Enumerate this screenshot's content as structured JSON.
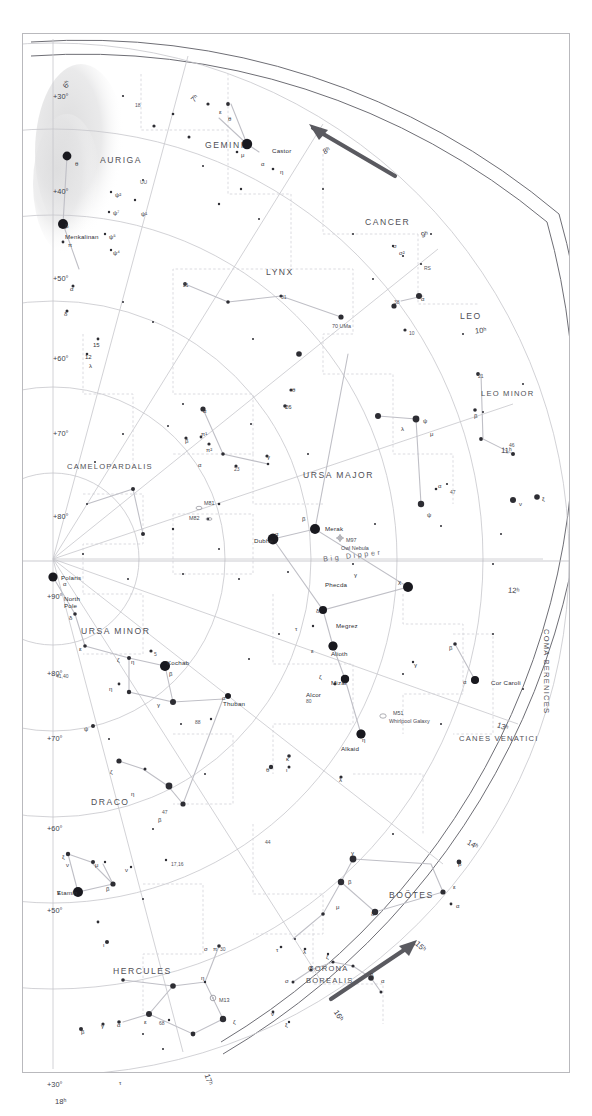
{
  "title": "STAR MAP 2: NORTHERN STARS TO DEC. +30°",
  "chart_data": {
    "type": "scatter",
    "title": "STAR MAP 2: NORTHERN STARS TO DEC. +30°",
    "projection": "polar-azimuthal north",
    "grid": true,
    "xlabel": "Right Ascension (hours)",
    "ylabel": "Declination (degrees)",
    "declination_labels": [
      "+90°",
      "+80°",
      "+70°",
      "+60°",
      "+50°",
      "+40°",
      "+30°"
    ],
    "ra_labels": [
      "6ʰ",
      "7ʰ",
      "8ʰ",
      "9ʰ",
      "10ʰ",
      "11ʰ",
      "12ʰ",
      "13ʰ",
      "14ʰ",
      "15ʰ",
      "16ʰ",
      "17ʰ",
      "18ʰ"
    ],
    "constellations": [
      "AURIGA",
      "GEMINI",
      "CANCER",
      "LYNX",
      "LEO",
      "LEO MINOR",
      "CAMELOPARDALIS",
      "URSA MAJOR",
      "URSA MINOR",
      "DRACO",
      "CANES VENATICI",
      "COMA BERENICES",
      "BOÖTES",
      "CORONA BOREALIS",
      "HERCULES"
    ],
    "named_stars": [
      "Castor",
      "Menkalinan",
      "Polaris",
      "Kochab",
      "Thuban",
      "Etamin",
      "Dubhe",
      "Merak",
      "Phecda",
      "Megrez",
      "Alioth",
      "Mizar",
      "Alcor",
      "Alkaid",
      "Cor Caroli"
    ],
    "deep_sky_objects": [
      "M81",
      "M82",
      "M97 Owl Nebula",
      "M51 Whirlpool Galaxy",
      "M13"
    ],
    "asterisms": [
      "Big Dipper"
    ]
  },
  "declination": [
    {
      "text": "+90°",
      "x": 24,
      "y": 558
    },
    {
      "text": "+80°",
      "x": 24,
      "y": 635
    },
    {
      "text": "+70°",
      "x": 24,
      "y": 700
    },
    {
      "text": "+60°",
      "x": 24,
      "y": 790
    },
    {
      "text": "+50°",
      "x": 24,
      "y": 872
    },
    {
      "text": "+30°",
      "x": 24,
      "y": 1046
    },
    {
      "text": "+30°",
      "x": 30,
      "y": 58
    },
    {
      "text": "+40°",
      "x": 30,
      "y": 153
    },
    {
      "text": "+50°",
      "x": 30,
      "y": 240
    },
    {
      "text": "+60°",
      "x": 30,
      "y": 320
    },
    {
      "text": "+70°",
      "x": 30,
      "y": 395
    },
    {
      "text": "+80°",
      "x": 30,
      "y": 478
    }
  ],
  "ra_ticks": [
    {
      "text": "6ʰ",
      "x": 40,
      "y": 46,
      "rot": -62
    },
    {
      "text": "7ʰ",
      "x": 168,
      "y": 60,
      "rot": -46
    },
    {
      "text": "8ʰ",
      "x": 300,
      "y": 112,
      "rot": -28
    },
    {
      "text": "9ʰ",
      "x": 398,
      "y": 196,
      "rot": -14
    },
    {
      "text": "10ʰ",
      "x": 452,
      "y": 292,
      "rot": -6
    },
    {
      "text": "11ʰ",
      "x": 478,
      "y": 412,
      "rot": 2
    },
    {
      "text": "12ʰ",
      "x": 485,
      "y": 552,
      "rot": 6
    },
    {
      "text": "13ʰ",
      "x": 474,
      "y": 688,
      "rot": 18
    },
    {
      "text": "14ʰ",
      "x": 444,
      "y": 806,
      "rot": 30
    },
    {
      "text": "15ʰ",
      "x": 392,
      "y": 908,
      "rot": 44
    },
    {
      "text": "16ʰ",
      "x": 310,
      "y": 977,
      "rot": 58
    },
    {
      "text": "17ʰ",
      "x": 180,
      "y": 1041,
      "rot": 70
    },
    {
      "text": "18ʰ",
      "x": 32,
      "y": 1063,
      "rot": 0
    }
  ],
  "constellation_labels": [
    {
      "text": "AURIGA",
      "x": 77,
      "y": 121,
      "cls": "const"
    },
    {
      "text": "GEMINI",
      "x": 182,
      "y": 106,
      "cls": "const"
    },
    {
      "text": "CANCER",
      "x": 342,
      "y": 183,
      "cls": "const"
    },
    {
      "text": "LYNX",
      "x": 243,
      "y": 233,
      "cls": "const"
    },
    {
      "text": "LEO",
      "x": 437,
      "y": 277,
      "cls": "const"
    },
    {
      "text": "LEO MINOR",
      "x": 458,
      "y": 355,
      "cls": "const sm"
    },
    {
      "text": "CAMELOPARDALIS",
      "x": 44,
      "y": 428,
      "cls": "const sm"
    },
    {
      "text": "URSA MAJOR",
      "x": 280,
      "y": 436,
      "cls": "const"
    },
    {
      "text": "URSA MINOR",
      "x": 58,
      "y": 592,
      "cls": "const"
    },
    {
      "text": "DRACO",
      "x": 68,
      "y": 763,
      "cls": "const"
    },
    {
      "text": "CANES VENATICI",
      "x": 436,
      "y": 700,
      "cls": "const sm"
    },
    {
      "text": "BOÖTES",
      "x": 366,
      "y": 856,
      "cls": "const"
    },
    {
      "text": "CORONA",
      "x": 285,
      "y": 930,
      "cls": "const sm"
    },
    {
      "text": "BOREALIS",
      "x": 283,
      "y": 942,
      "cls": "const sm"
    },
    {
      "text": "HERCULES",
      "x": 90,
      "y": 932,
      "cls": "const"
    }
  ],
  "coma_berenices": "COMA BERENICES",
  "star_labels": [
    {
      "text": "Castor",
      "x": 249,
      "y": 113
    },
    {
      "text": "Menkalinan",
      "x": 42,
      "y": 199
    },
    {
      "text": "Polaris",
      "x": 38,
      "y": 540
    },
    {
      "text": "North",
      "x": 41,
      "y": 561
    },
    {
      "text": "Pole",
      "x": 41,
      "y": 568
    },
    {
      "text": "Kochab",
      "x": 144,
      "y": 625
    },
    {
      "text": "Thuban",
      "x": 200,
      "y": 666
    },
    {
      "text": "Etamin",
      "x": 34,
      "y": 855
    },
    {
      "text": "Dubhe",
      "x": 231,
      "y": 503
    },
    {
      "text": "Merak",
      "x": 302,
      "y": 491
    },
    {
      "text": "Phecda",
      "x": 302,
      "y": 547
    },
    {
      "text": "Megrez",
      "x": 313,
      "y": 588
    },
    {
      "text": "Alioth",
      "x": 308,
      "y": 616
    },
    {
      "text": "Mizar",
      "x": 308,
      "y": 645
    },
    {
      "text": "Alcor",
      "x": 283,
      "y": 657
    },
    {
      "text": "Alkaid",
      "x": 318,
      "y": 711
    },
    {
      "text": "Cor Caroli",
      "x": 468,
      "y": 645
    }
  ],
  "dso_labels": [
    {
      "text": "M81",
      "x": 181,
      "y": 466
    },
    {
      "text": "M82",
      "x": 166,
      "y": 481
    },
    {
      "text": "M97",
      "x": 323,
      "y": 503
    },
    {
      "text": "Owl Nebula",
      "x": 318,
      "y": 511
    },
    {
      "text": "M51",
      "x": 370,
      "y": 676
    },
    {
      "text": "Whirlpool Galaxy",
      "x": 366,
      "y": 684
    },
    {
      "text": "M13",
      "x": 196,
      "y": 963
    },
    {
      "text": "70 UMa",
      "x": 309,
      "y": 289
    }
  ],
  "asterism_label": "Big Dipper",
  "misc_labels": [
    {
      "text": "41,40",
      "x": 33,
      "y": 639
    },
    {
      "text": "17,16",
      "x": 148,
      "y": 827
    },
    {
      "text": "21",
      "x": 160,
      "y": 248
    },
    {
      "text": "31",
      "x": 258,
      "y": 260
    },
    {
      "text": "38",
      "x": 371,
      "y": 265
    },
    {
      "text": "10",
      "x": 386,
      "y": 296
    },
    {
      "text": "23",
      "x": 211,
      "y": 432
    },
    {
      "text": "21",
      "x": 455,
      "y": 339
    },
    {
      "text": "46",
      "x": 486,
      "y": 408
    },
    {
      "text": "47",
      "x": 427,
      "y": 455
    },
    {
      "text": "5",
      "x": 131,
      "y": 617
    },
    {
      "text": "80",
      "x": 283,
      "y": 664
    },
    {
      "text": "88",
      "x": 172,
      "y": 685
    },
    {
      "text": "47",
      "x": 139,
      "y": 775
    },
    {
      "text": "44",
      "x": 242,
      "y": 805
    },
    {
      "text": "30",
      "x": 197,
      "y": 912
    },
    {
      "text": "68",
      "x": 136,
      "y": 986
    },
    {
      "text": "18",
      "x": 112,
      "y": 68
    },
    {
      "text": "UU",
      "x": 117,
      "y": 145
    },
    {
      "text": "RS",
      "x": 401,
      "y": 231
    }
  ],
  "greek_labels": [
    {
      "t": "θ",
      "x": 52,
      "y": 127
    },
    {
      "t": "β",
      "x": 42,
      "y": 189
    },
    {
      "t": "π",
      "x": 45,
      "y": 208
    },
    {
      "t": "ε",
      "x": 196,
      "y": 75
    },
    {
      "t": "μ",
      "x": 218,
      "y": 118
    },
    {
      "t": "α",
      "x": 238,
      "y": 127
    },
    {
      "t": "η",
      "x": 257,
      "y": 135
    },
    {
      "t": "θ",
      "x": 205,
      "y": 82
    },
    {
      "t": "ψ²",
      "x": 92,
      "y": 158
    },
    {
      "t": "ψ⁷",
      "x": 90,
      "y": 176
    },
    {
      "t": "ψ⁵",
      "x": 86,
      "y": 200
    },
    {
      "t": "ψ⁴",
      "x": 90,
      "y": 216
    },
    {
      "t": "ψ¹",
      "x": 118,
      "y": 177
    },
    {
      "t": "α",
      "x": 47,
      "y": 252
    },
    {
      "t": "δ",
      "x": 41,
      "y": 277
    },
    {
      "t": "15",
      "x": 70,
      "y": 308
    },
    {
      "t": "12",
      "x": 62,
      "y": 320
    },
    {
      "t": "λ",
      "x": 66,
      "y": 329
    },
    {
      "t": "α",
      "x": 398,
      "y": 262
    },
    {
      "t": "σ",
      "x": 370,
      "y": 209
    },
    {
      "t": "σ²",
      "x": 376,
      "y": 216
    },
    {
      "t": "α",
      "x": 180,
      "y": 374
    },
    {
      "t": "β",
      "x": 162,
      "y": 404
    },
    {
      "t": "π¹",
      "x": 178,
      "y": 397
    },
    {
      "t": "π²",
      "x": 183,
      "y": 413
    },
    {
      "t": "γ",
      "x": 244,
      "y": 420
    },
    {
      "t": "α",
      "x": 175,
      "y": 428
    },
    {
      "t": "θ",
      "x": 269,
      "y": 353
    },
    {
      "t": "26",
      "x": 262,
      "y": 370
    },
    {
      "t": "ψ",
      "x": 400,
      "y": 384
    },
    {
      "t": "λ",
      "x": 378,
      "y": 392
    },
    {
      "t": "μ",
      "x": 407,
      "y": 397
    },
    {
      "t": "β",
      "x": 451,
      "y": 379
    },
    {
      "t": "ψ",
      "x": 404,
      "y": 478
    },
    {
      "t": "α",
      "x": 415,
      "y": 449
    },
    {
      "t": "ν",
      "x": 496,
      "y": 467
    },
    {
      "t": "ξ",
      "x": 519,
      "y": 462
    },
    {
      "t": "β",
      "x": 279,
      "y": 482
    },
    {
      "t": "α",
      "x": 252,
      "y": 497
    },
    {
      "t": "γ",
      "x": 331,
      "y": 538
    },
    {
      "t": "χ",
      "x": 375,
      "y": 545
    },
    {
      "t": "δ",
      "x": 293,
      "y": 574
    },
    {
      "t": "τ",
      "x": 272,
      "y": 592
    },
    {
      "t": "ε",
      "x": 288,
      "y": 614
    },
    {
      "t": "ζ",
      "x": 296,
      "y": 640
    },
    {
      "t": "η",
      "x": 339,
      "y": 703
    },
    {
      "t": "κ",
      "x": 263,
      "y": 722
    },
    {
      "t": "ι",
      "x": 263,
      "y": 733
    },
    {
      "t": "θ",
      "x": 243,
      "y": 733
    },
    {
      "t": "λ",
      "x": 316,
      "y": 743
    },
    {
      "t": "α",
      "x": 440,
      "y": 645
    },
    {
      "t": "β",
      "x": 426,
      "y": 611
    },
    {
      "t": "γ",
      "x": 391,
      "y": 628
    },
    {
      "t": "α",
      "x": 40,
      "y": 547
    },
    {
      "t": "δ",
      "x": 46,
      "y": 581
    },
    {
      "t": "ε",
      "x": 56,
      "y": 612
    },
    {
      "t": "ζ",
      "x": 94,
      "y": 623
    },
    {
      "t": "η",
      "x": 108,
      "y": 625
    },
    {
      "t": "β",
      "x": 146,
      "y": 637
    },
    {
      "t": "γ",
      "x": 134,
      "y": 668
    },
    {
      "t": "η",
      "x": 86,
      "y": 652
    },
    {
      "t": "ψ",
      "x": 61,
      "y": 692
    },
    {
      "t": "α",
      "x": 199,
      "y": 661
    },
    {
      "t": "ζ",
      "x": 87,
      "y": 735
    },
    {
      "t": "η",
      "x": 108,
      "y": 757
    },
    {
      "t": "β",
      "x": 135,
      "y": 783
    },
    {
      "t": "ξ",
      "x": 39,
      "y": 820
    },
    {
      "t": "ν",
      "x": 43,
      "y": 828
    },
    {
      "t": "μ",
      "x": 72,
      "y": 828
    },
    {
      "t": "ν",
      "x": 102,
      "y": 833
    },
    {
      "t": "γ",
      "x": 34,
      "y": 855
    },
    {
      "t": "β",
      "x": 83,
      "y": 852
    },
    {
      "t": "γ",
      "x": 328,
      "y": 816
    },
    {
      "t": "β",
      "x": 325,
      "y": 845
    },
    {
      "t": "δ",
      "x": 348,
      "y": 877
    },
    {
      "t": "μ",
      "x": 313,
      "y": 870
    },
    {
      "t": "ε",
      "x": 430,
      "y": 850
    },
    {
      "t": "α",
      "x": 433,
      "y": 869
    },
    {
      "t": "β",
      "x": 435,
      "y": 827
    },
    {
      "t": "β",
      "x": 347,
      "y": 938
    },
    {
      "t": "α",
      "x": 358,
      "y": 944
    },
    {
      "t": "λ",
      "x": 280,
      "y": 915
    },
    {
      "t": "ζ",
      "x": 303,
      "y": 920
    },
    {
      "t": "κ",
      "x": 287,
      "y": 930
    },
    {
      "t": "τ",
      "x": 253,
      "y": 913
    },
    {
      "t": "σ",
      "x": 262,
      "y": 944
    },
    {
      "t": "η",
      "x": 178,
      "y": 941
    },
    {
      "t": "π",
      "x": 190,
      "y": 912
    },
    {
      "t": "ζ",
      "x": 210,
      "y": 985
    },
    {
      "t": "ε",
      "x": 121,
      "y": 985
    },
    {
      "t": "β",
      "x": 58,
      "y": 995
    },
    {
      "t": "γ",
      "x": 78,
      "y": 989
    },
    {
      "t": "α",
      "x": 94,
      "y": 988
    },
    {
      "t": "ι",
      "x": 80,
      "y": 908
    },
    {
      "t": "σ",
      "x": 181,
      "y": 912
    },
    {
      "t": "ν",
      "x": 248,
      "y": 977
    },
    {
      "t": "ξ",
      "x": 262,
      "y": 988
    },
    {
      "t": "τ",
      "x": 96,
      "y": 1046
    }
  ],
  "colors": {
    "ink": "#2d2d33",
    "grid": "#c6c6cc",
    "constellation_line": "#bfbfc6",
    "border": "#b9b9bd",
    "boundary": "#cfcfd6",
    "milkyway": "#e2e2e3",
    "arrow": "#5a5a60",
    "title": "#4b4b52"
  }
}
